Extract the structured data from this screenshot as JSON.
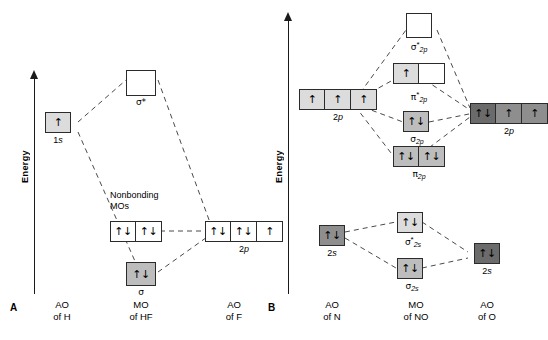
{
  "figure": {
    "panels": [
      {
        "letter": "A",
        "axis_label": "Energy",
        "columns": [
          {
            "heading_line1": "AO",
            "heading_line2": "of H"
          },
          {
            "heading_line1": "MO",
            "heading_line2": "of HF"
          },
          {
            "heading_line1": "AO",
            "heading_line2": "of F"
          }
        ],
        "levels": [
          {
            "id": "h-1s",
            "label": "1s",
            "label_italic_part": "s",
            "label_plain_part": "1",
            "boxes": [
              {
                "fill": "light",
                "electrons": "↑"
              }
            ]
          },
          {
            "id": "hf-sigma-star",
            "label": "σ*",
            "boxes": [
              {
                "fill": "white",
                "electrons": ""
              }
            ]
          },
          {
            "id": "hf-nonbonding",
            "label": "Nonbonding MOs",
            "label_line1": "Nonbonding",
            "label_line2": "MOs",
            "boxes": [
              {
                "fill": "white",
                "electrons": "↑↓"
              },
              {
                "fill": "white",
                "electrons": "↑↓"
              }
            ]
          },
          {
            "id": "f-2p",
            "label": "2p",
            "label_plain_part": "2",
            "label_italic_part": "p",
            "boxes": [
              {
                "fill": "white",
                "electrons": "↑↓"
              },
              {
                "fill": "white",
                "electrons": "↑↓"
              },
              {
                "fill": "white",
                "electrons": "↑"
              }
            ]
          },
          {
            "id": "hf-sigma",
            "label": "σ",
            "boxes": [
              {
                "fill": "mid",
                "electrons": "↑↓"
              }
            ]
          }
        ]
      },
      {
        "letter": "B",
        "axis_label": "Energy",
        "columns": [
          {
            "heading_line1": "AO",
            "heading_line2": "of N"
          },
          {
            "heading_line1": "MO",
            "heading_line2": "of NO"
          },
          {
            "heading_line1": "AO",
            "heading_line2": "of O"
          }
        ],
        "levels": [
          {
            "id": "no-sigma2p-star",
            "label": "σ*2p",
            "greek": "σ",
            "star": "*",
            "sub": "2p",
            "boxes": [
              {
                "fill": "white",
                "electrons": ""
              }
            ]
          },
          {
            "id": "no-pi2p-star",
            "label": "π*2p",
            "greek": "π",
            "star": "*",
            "sub": "2p",
            "boxes": [
              {
                "fill": "light",
                "electrons": "↑"
              },
              {
                "fill": "white",
                "electrons": ""
              }
            ]
          },
          {
            "id": "n-2p",
            "label": "2p",
            "label_plain_part": "2",
            "label_italic_part": "p",
            "boxes": [
              {
                "fill": "light",
                "electrons": "↑"
              },
              {
                "fill": "light",
                "electrons": "↑"
              },
              {
                "fill": "light",
                "electrons": "↑"
              }
            ]
          },
          {
            "id": "o-2p",
            "label": "2p",
            "label_plain_part": "2",
            "label_italic_part": "p",
            "boxes": [
              {
                "fill": "darker",
                "electrons": "↑↓"
              },
              {
                "fill": "dark",
                "electrons": "↑"
              },
              {
                "fill": "dark",
                "electrons": "↑"
              }
            ]
          },
          {
            "id": "no-sigma2p",
            "label": "σ2p",
            "greek": "σ",
            "star": "",
            "sub": "2p",
            "boxes": [
              {
                "fill": "mid",
                "electrons": "↑↓"
              }
            ]
          },
          {
            "id": "no-pi2p",
            "label": "π2p",
            "greek": "π",
            "star": "",
            "sub": "2p",
            "boxes": [
              {
                "fill": "mid",
                "electrons": "↑↓"
              },
              {
                "fill": "mid",
                "electrons": "↑↓"
              }
            ]
          },
          {
            "id": "n-2s",
            "label": "2s",
            "label_plain_part": "2",
            "label_italic_part": "s",
            "boxes": [
              {
                "fill": "dark",
                "electrons": "↑↓"
              }
            ]
          },
          {
            "id": "no-sigma2s-star",
            "label": "σ*2s",
            "greek": "σ",
            "star": "*",
            "sub": "2s",
            "boxes": [
              {
                "fill": "light",
                "electrons": "↑↓"
              }
            ]
          },
          {
            "id": "no-sigma2s",
            "label": "σ2s",
            "greek": "σ",
            "star": "",
            "sub": "2s",
            "boxes": [
              {
                "fill": "mid",
                "electrons": "↑↓"
              }
            ]
          },
          {
            "id": "o-2s",
            "label": "2s",
            "label_plain_part": "2",
            "label_italic_part": "s",
            "boxes": [
              {
                "fill": "darker",
                "electrons": "↑↓"
              }
            ]
          }
        ]
      }
    ]
  }
}
